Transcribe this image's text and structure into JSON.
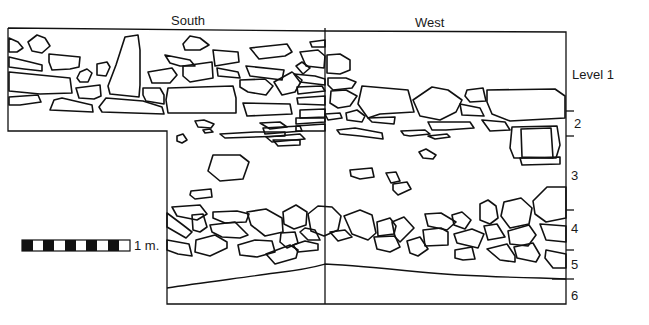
{
  "figure": {
    "type": "archaeological section drawing",
    "faces": [
      {
        "label": "South"
      },
      {
        "label": "West"
      }
    ],
    "levels": [
      {
        "label": "Level 1"
      },
      {
        "label": "2"
      },
      {
        "label": "3"
      },
      {
        "label": "4"
      },
      {
        "label": "5"
      },
      {
        "label": "6"
      }
    ],
    "scale_bar": {
      "label": "1 m.",
      "segments": 10,
      "colors": {
        "dark": "#111111",
        "light": "#ffffff"
      }
    },
    "line_color": "#111111",
    "background": "#ffffff"
  }
}
